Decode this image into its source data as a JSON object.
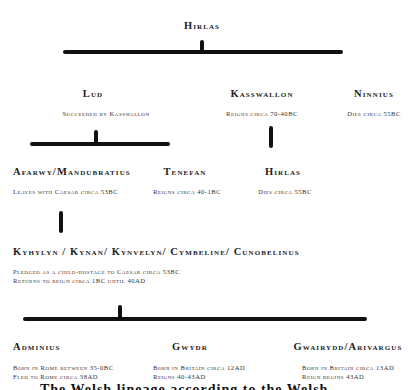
{
  "diagram": {
    "type": "family-tree",
    "root": {
      "name": "Hirlas"
    },
    "generation_1": [
      {
        "name": "Lud",
        "note": "Succeeded by Kasswallon"
      },
      {
        "name": "Kasswallon",
        "note": "Reigns circa 70-40BC"
      },
      {
        "name": "Ninnius",
        "note": "Dies circa 55BC"
      }
    ],
    "generation_2": [
      {
        "name": "Afarwy/Mandubratius",
        "note": "Leaves with Caesar circa 53BC",
        "parent": "Lud"
      },
      {
        "name": "Tenefan",
        "note": "Reigns circa 40-1BC",
        "parent": "Lud"
      },
      {
        "name": "Hirlas",
        "note": "Dies circa 55BC",
        "parent": "Kasswallon"
      }
    ],
    "generation_3": {
      "name": "Kyhylyn / Kynan/ Kynvelyn/ Cymbeline/ Cunobelinus",
      "notes": [
        "Pledged as a child-hostage to Caesar circa 53BC",
        "Returns to reign circa 1BC until 40AD"
      ],
      "parent": "Afarwy/Mandubratius"
    },
    "generation_4": [
      {
        "name": "Adminius",
        "notes": [
          "Born in Rome between 35-0BC",
          "Fled to Rome circa 38AD"
        ]
      },
      {
        "name": "Gwydr",
        "notes": [
          "Born in Britain circa 12AD",
          "Reigns 40-43AD"
        ]
      },
      {
        "name": "Gwairydd/Arivargus",
        "notes": [
          "Born in Britain circa 13AD",
          "Reign begins 43AD"
        ]
      }
    ],
    "caption_partial": "The Welsh lineage according to the Welsh"
  }
}
